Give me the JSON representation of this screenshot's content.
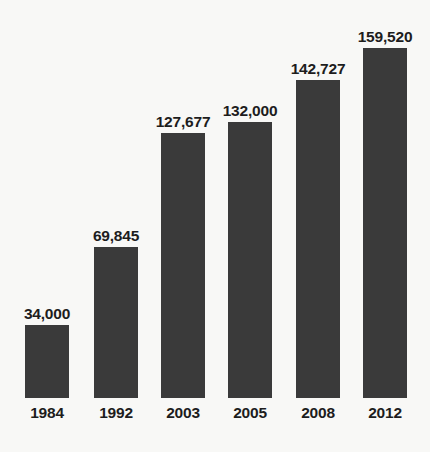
{
  "chart_data": {
    "type": "bar",
    "title": "",
    "subtitle": "",
    "xlabel": "",
    "ylabel": "",
    "categories": [
      "1984",
      "1992",
      "2003",
      "2005",
      "2008",
      "2012"
    ],
    "values": [
      34000,
      69845,
      127677,
      132000,
      142727,
      159520
    ],
    "value_labels": [
      "34,000",
      "69,845",
      "127,677",
      "132,000",
      "142,727",
      "159,520"
    ],
    "ylim": [
      0,
      159520
    ],
    "grid": false,
    "axis_lines": false,
    "legend": null,
    "orientation": "vertical",
    "bar_color": "#3a3a3a",
    "background_color": "#f8f8f6",
    "text_color": "#1d1d1d",
    "bars": [
      {
        "category": "1984",
        "value": 34000,
        "value_label": "34,000",
        "height_px": 73
      },
      {
        "category": "1992",
        "value": 69845,
        "value_label": "69,845",
        "height_px": 151
      },
      {
        "category": "2003",
        "value": 127677,
        "value_label": "127,677",
        "height_px": 265
      },
      {
        "category": "2005",
        "value": 132000,
        "value_label": "132,000",
        "height_px": 276
      },
      {
        "category": "2008",
        "value": 142727,
        "value_label": "142,727",
        "height_px": 318
      },
      {
        "category": "2012",
        "value": 159520,
        "value_label": "159,520",
        "height_px": 350
      }
    ]
  }
}
